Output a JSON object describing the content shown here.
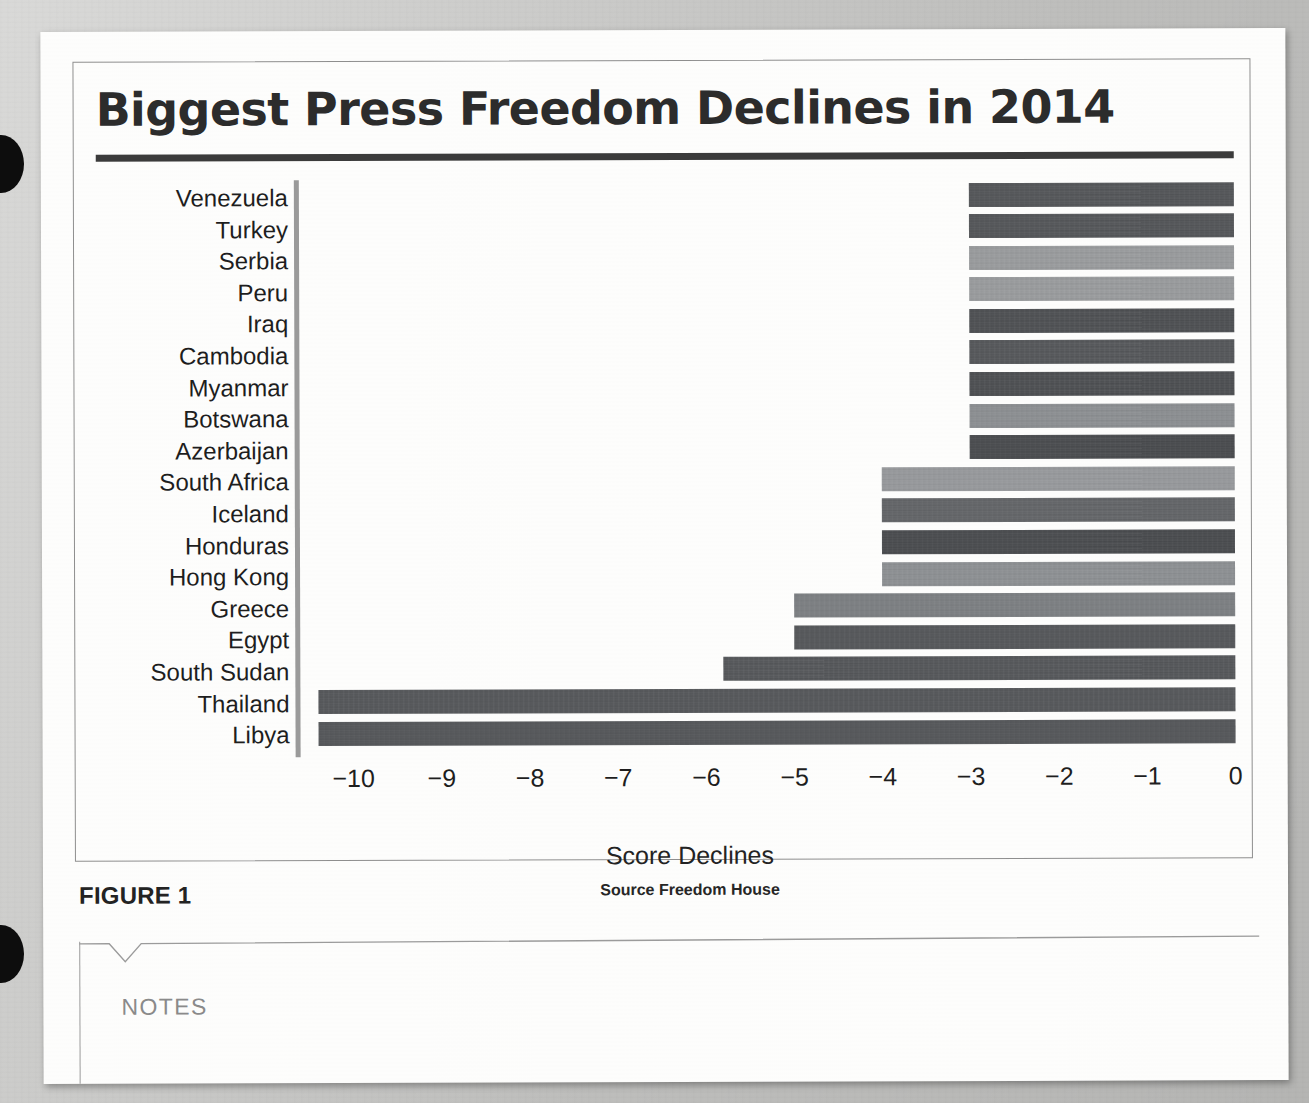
{
  "page": {
    "top_fragment": "",
    "figure_caption": "FIGURE 1",
    "notes_label": "NOTES"
  },
  "chart_data": {
    "type": "bar",
    "orientation": "horizontal",
    "title": "Biggest Press Freedom Declines in 2014",
    "xlabel": "Score Declines",
    "ylabel": "",
    "source": "Source Freedom House",
    "xlim": [
      -10.6,
      0
    ],
    "xticks": [
      -10,
      -9,
      -8,
      -7,
      -6,
      -5,
      -4,
      -3,
      -2,
      -1,
      0
    ],
    "xtick_labels": [
      "−10",
      "−9",
      "−8",
      "−7",
      "−6",
      "−5",
      "−4",
      "−3",
      "−2",
      "−1",
      "0"
    ],
    "grid": false,
    "legend": null,
    "categories": [
      "Venezuela",
      "Turkey",
      "Serbia",
      "Peru",
      "Iraq",
      "Cambodia",
      "Myanmar",
      "Botswana",
      "Azerbaijan",
      "South Africa",
      "Iceland",
      "Honduras",
      "Hong Kong",
      "Greece",
      "Egypt",
      "South Sudan",
      "Thailand",
      "Libya"
    ],
    "values": [
      -3,
      -3,
      -3,
      -3,
      -3,
      -3,
      -3,
      -3,
      -3,
      -4,
      -4,
      -4,
      -4,
      -5,
      -5,
      -5.8,
      -10.4,
      -10.4
    ],
    "bar_colors": [
      "#55575a",
      "#55575a",
      "#9a9c9e",
      "#9a9c9e",
      "#4f5154",
      "#56585b",
      "#4e5053",
      "#8d9093",
      "#4b4d50",
      "#989a9d",
      "#646669",
      "#4b4d50",
      "#8e9194",
      "#7d8083",
      "#56585b",
      "#56585b",
      "#56585b",
      "#56585b"
    ],
    "colors": {
      "dark": "#4b4d50",
      "medium": "#646669",
      "light": "#9a9c9e",
      "axis": "#9a9a9a",
      "title_rule": "#3b3b3b",
      "text": "#1e1e1e"
    }
  }
}
